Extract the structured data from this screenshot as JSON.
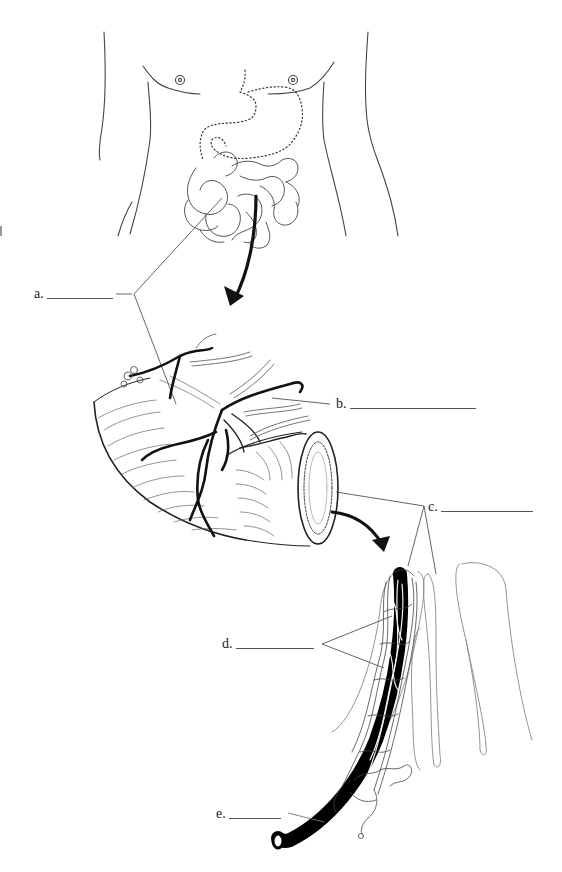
{
  "diagram": {
    "type": "anatomical-labeling-worksheet",
    "panels": [
      {
        "id": "torso",
        "depicts": "human torso with stomach (dotted outline) and small intestine"
      },
      {
        "id": "intestine-section",
        "depicts": "cut section of small intestine with blood vessels and mesentery"
      },
      {
        "id": "villi",
        "depicts": "intestinal villi with capillary network and lacteal"
      }
    ],
    "arrows": [
      {
        "from": "torso",
        "to": "intestine-section"
      },
      {
        "from": "intestine-section",
        "to": "villi"
      }
    ]
  },
  "labels": [
    {
      "letter": "a.",
      "blank": "",
      "name": "label-a"
    },
    {
      "letter": "b.",
      "blank": "",
      "name": "label-b"
    },
    {
      "letter": "c.",
      "blank": "",
      "name": "label-c"
    },
    {
      "letter": "d.",
      "blank": "",
      "name": "label-d"
    },
    {
      "letter": "e.",
      "blank": "",
      "name": "label-e"
    }
  ],
  "colors": {
    "line": "#1a1a1a",
    "outline": "#555555",
    "faint": "#999999",
    "background": "#ffffff"
  }
}
